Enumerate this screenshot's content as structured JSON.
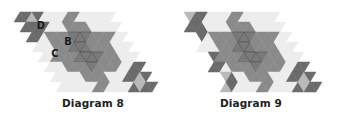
{
  "colors": {
    "dark": "#6b6b6b",
    "mid": "#8a8a8a",
    "center": "#7a7a7a",
    "light": "#b9b9b9",
    "pale": "#ededed",
    "stroke": "#4a4a4a"
  },
  "diagrams": [
    {
      "id": "8",
      "caption": "Diagram 8",
      "origin": [
        20,
        12
      ],
      "labels": [
        {
          "text": "D",
          "i": 0.55,
          "j": 0.45
        },
        {
          "text": "B",
          "i": 1.75,
          "j": 1.45
        },
        {
          "text": "C",
          "i": 0.85,
          "j": 1.75
        }
      ],
      "shapes": [
        {
          "fill": "dark",
          "pts": [
            [
              0,
              0
            ],
            [
              1,
              0
            ],
            [
              0.5,
              0.5
            ]
          ]
        },
        {
          "fill": "light",
          "pts": [
            [
              0.5,
              0.5
            ],
            [
              0.5,
              0
            ],
            [
              1,
              0
            ]
          ]
        },
        {
          "fill": "dark",
          "pts": [
            [
              0,
              0
            ],
            [
              0.5,
              0
            ],
            [
              0.5,
              0.5
            ],
            [
              0,
              0.5
            ]
          ]
        },
        {
          "fill": "dark",
          "pts": [
            [
              0.5,
              0
            ],
            [
              1,
              0
            ],
            [
              1,
              0.5
            ],
            [
              0.5,
              0.5
            ]
          ]
        },
        {
          "fill": "light",
          "pts": [
            [
              0.5,
              0
            ],
            [
              1,
              0
            ],
            [
              0.5,
              0.5
            ]
          ]
        },
        {
          "fill": "dark",
          "pts": [
            [
              0,
              0.5
            ],
            [
              0.5,
              0.5
            ],
            [
              0,
              1
            ]
          ]
        },
        {
          "fill": "dark",
          "pts": [
            [
              0.5,
              0.5
            ],
            [
              0.5,
              1
            ],
            [
              0,
              1
            ]
          ]
        },
        {
          "fill": "pale",
          "pts": [
            [
              1,
              0
            ],
            [
              2,
              0
            ],
            [
              1,
              1
            ]
          ]
        },
        {
          "fill": "pale",
          "pts": [
            [
              0.5,
              0.5
            ],
            [
              1,
              0.5
            ],
            [
              1,
              1
            ],
            [
              0.5,
              1
            ]
          ]
        },
        {
          "fill": "pale",
          "pts": [
            [
              3,
              0
            ],
            [
              4,
              0
            ],
            [
              3,
              1
            ]
          ]
        },
        {
          "fill": "pale",
          "pts": [
            [
              0,
              1
            ],
            [
              1,
              1
            ],
            [
              0,
              2
            ]
          ]
        },
        {
          "fill": "pale",
          "pts": [
            [
              3,
              1
            ],
            [
              4,
              1
            ],
            [
              3,
              2
            ]
          ]
        },
        {
          "fill": "pale",
          "pts": [
            [
              0,
              3
            ],
            [
              1,
              3
            ],
            [
              0,
              4
            ]
          ]
        },
        {
          "fill": "pale",
          "pts": [
            [
              1,
              3
            ],
            [
              2,
              3
            ],
            [
              1,
              4
            ]
          ]
        },
        {
          "fill": "pale",
          "pts": [
            [
              2,
              3
            ],
            [
              3,
              3
            ],
            [
              2,
              4
            ]
          ]
        },
        {
          "fill": "pale",
          "pts": [
            [
              1,
              3
            ],
            [
              1,
              4
            ],
            [
              0,
              4
            ]
          ]
        },
        {
          "fill": "pale",
          "pts": [
            [
              3,
              1
            ],
            [
              4,
              1
            ],
            [
              3,
              2
            ]
          ]
        },
        {
          "fill": "mid",
          "pts": [
            [
              2,
              0
            ],
            [
              2.5,
              0.5
            ],
            [
              2,
              1
            ],
            [
              1.5,
              1.5
            ],
            [
              1,
              1
            ],
            [
              1.5,
              0.5
            ]
          ]
        },
        {
          "fill": "mid",
          "pts": [
            [
              1,
              1
            ],
            [
              2,
              1
            ],
            [
              1,
              2
            ]
          ]
        },
        {
          "fill": "mid",
          "pts": [
            [
              2,
              0
            ],
            [
              3,
              0
            ],
            [
              2,
              1
            ]
          ]
        },
        {
          "fill": "mid",
          "pts": [
            [
              2,
              1
            ],
            [
              3,
              1
            ],
            [
              2,
              2
            ]
          ]
        },
        {
          "fill": "mid",
          "pts": [
            [
              1,
              2
            ],
            [
              2,
              2
            ],
            [
              1,
              3
            ]
          ]
        },
        {
          "fill": "mid",
          "pts": [
            [
              2,
              2
            ],
            [
              3,
              2
            ],
            [
              2,
              3
            ]
          ]
        },
        {
          "fill": "mid",
          "pts": [
            [
              1,
              2
            ],
            [
              1,
              3
            ],
            [
              0,
              3
            ]
          ]
        },
        {
          "fill": "mid",
          "pts": [
            [
              2,
              1
            ],
            [
              2,
              2
            ],
            [
              1,
              2
            ]
          ]
        },
        {
          "fill": "mid",
          "pts": [
            [
              3,
              1
            ],
            [
              3,
              2
            ],
            [
              2,
              2
            ]
          ]
        },
        {
          "fill": "mid",
          "pts": [
            [
              2,
              2
            ],
            [
              2,
              3
            ],
            [
              1,
              3
            ]
          ]
        },
        {
          "fill": "mid",
          "pts": [
            [
              3,
              0
            ],
            [
              3,
              1
            ],
            [
              2,
              1
            ]
          ]
        },
        {
          "fill": "pale",
          "pts": [
            [
              4,
              0
            ],
            [
              4,
              1
            ],
            [
              3,
              1
            ]
          ]
        },
        {
          "fill": "pale",
          "pts": [
            [
              1,
              1
            ],
            [
              1,
              2
            ],
            [
              0,
              2
            ]
          ]
        },
        {
          "fill": "pale",
          "pts": [
            [
              4,
              1
            ],
            [
              4,
              2
            ],
            [
              3,
              2
            ]
          ]
        },
        {
          "fill": "pale",
          "pts": [
            [
              2,
              3
            ],
            [
              2,
              4
            ],
            [
              1,
              4
            ]
          ]
        },
        {
          "fill": "pale",
          "pts": [
            [
              3,
              2
            ],
            [
              3,
              3
            ],
            [
              2,
              3
            ]
          ]
        },
        {
          "fill": "pale",
          "pts": [
            [
              3,
              3
            ],
            [
              3,
              4
            ],
            [
              2,
              4
            ]
          ]
        },
        {
          "fill": "center",
          "pts": [
            [
              2,
              1
            ],
            [
              2.5,
              1
            ],
            [
              2.5,
              1.5
            ],
            [
              2,
              2
            ],
            [
              1.5,
              2
            ],
            [
              1.5,
              1.5
            ]
          ]
        },
        {
          "fill": "dark",
          "pts": [
            [
              3,
              2
            ],
            [
              4,
              2
            ],
            [
              3,
              3
            ]
          ]
        },
        {
          "fill": "dark",
          "pts": [
            [
              4,
              2
            ],
            [
              4,
              3
            ],
            [
              3,
              3
            ]
          ]
        },
        {
          "fill": "dark",
          "pts": [
            [
              3,
              3
            ],
            [
              4,
              3
            ],
            [
              3,
              4
            ]
          ]
        },
        {
          "fill": "dark",
          "pts": [
            [
              4,
              3
            ],
            [
              4,
              4
            ],
            [
              3,
              4
            ]
          ]
        },
        {
          "fill": "light",
          "pts": [
            [
              3.5,
              3
            ],
            [
              4,
              3
            ],
            [
              3.5,
              3.5
            ]
          ]
        },
        {
          "fill": "light",
          "pts": [
            [
              3.5,
              3
            ],
            [
              3.5,
              3.5
            ],
            [
              3,
              3.5
            ]
          ]
        }
      ]
    },
    {
      "id": "9",
      "caption": "Diagram 9",
      "origin": [
        25,
        12
      ],
      "labels": [],
      "shapes": []
    }
  ]
}
